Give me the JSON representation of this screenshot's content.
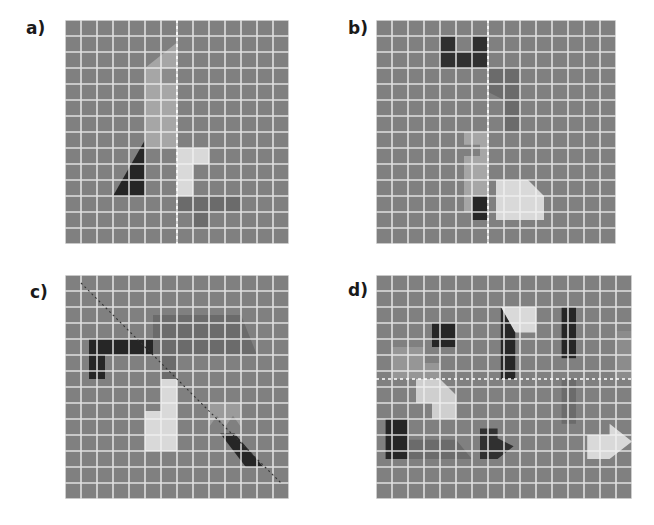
{
  "figure": {
    "width": 654,
    "height": 525,
    "background": "#ffffff"
  },
  "palette": {
    "grid_fill": "#808080",
    "grid_line": "#f2f2f2",
    "axis_dash": "#ffffff",
    "axis_dash_dark": "#333333",
    "label_color": "#1a1a1a",
    "shape_black": "#262626",
    "shape_darkgray": "#404040",
    "shape_midgray": "#595959",
    "shape_gray": "#737373",
    "shape_lightgray": "#a6a6a6",
    "shape_lighter": "#bfbfbf",
    "shape_verylight": "#d9d9d9",
    "shape_white": "#e6e6e6"
  },
  "panels": [
    {
      "id": "a",
      "label": "a)",
      "label_x": 26,
      "label_y": 20,
      "origin_x": 65,
      "origin_y": 20,
      "cols": 14,
      "rows": 14,
      "cell": 16,
      "grid_fill": "#808080",
      "grid_line": "#f2f2f2",
      "symmetry": {
        "type": "vertical",
        "position_cells": 7.0,
        "color": "#ffffff",
        "dash": "3,3"
      },
      "shapes": [
        {
          "name": "gray-pennant",
          "fill": "#a6a6a6",
          "points_cells": "5.0,8.0 5.0,3.0 7.0,1.4 7.0,8.0"
        },
        {
          "name": "gray-pennant-notch",
          "fill": "#8c8c8c",
          "points_cells": "6.0,3.0 7.0,3.0 7.0,4.0 6.0,4.0"
        },
        {
          "name": "black-triangle",
          "fill": "#262626",
          "points_cells": "3.0,11.0 5.0,7.5 5.0,11.0"
        },
        {
          "name": "light-hook",
          "fill": "#d9d9d9",
          "points_cells": "7.0,8.0 9.0,8.0 9.0,9.0 8.0,9.0 8.0,11.0 7.0,11.0"
        },
        {
          "name": "mid-tblock",
          "fill": "#6b6b6b",
          "points_cells": "7.0,11.0 11.0,11.0 11.0,12.0 9.0,12.0 9.0,13.0 8.0,13.0 8.0,12.0 7.0,12.0"
        }
      ]
    },
    {
      "id": "b",
      "label": "b)",
      "label_x": 348,
      "label_y": 20,
      "origin_x": 376,
      "origin_y": 20,
      "cols": 15,
      "rows": 14,
      "cell": 16,
      "grid_fill": "#808080",
      "grid_line": "#f2f2f2",
      "symmetry": {
        "type": "vertical",
        "position_cells": 7.0,
        "color": "#ffffff",
        "dash": "3,3"
      },
      "shapes": [
        {
          "name": "dark-ushape",
          "fill": "#303030",
          "points_cells": "4.0,1.0 5.0,1.0 5.0,2.0 6.0,2.0 6.0,1.0 7.0,1.0 7.0,3.0 4.0,3.0"
        },
        {
          "name": "gray-chevron",
          "fill": "#6b6b6b",
          "points_cells": "7.0,3.0 9.0,3.0 9.0,7.0 8.0,7.0 8.0,5.0 7.0,4.5"
        },
        {
          "name": "light-lshape",
          "fill": "#a6a6a6",
          "points_cells": "5.5,7.0 7.0,7.0 7.0,12.0 5.5,12.0 5.5,8.5 6.5,8.5 6.5,7.8 5.5,7.8"
        },
        {
          "name": "black-square",
          "fill": "#262626",
          "points_cells": "6.0,11.0 7.0,11.0 7.0,12.5 6.0,12.5"
        },
        {
          "name": "pale-pentagon",
          "fill": "#d9d9d9",
          "points_cells": "7.5,10.0 9.5,10.0 10.5,11.0 10.5,12.5 7.5,12.5"
        }
      ]
    },
    {
      "id": "c",
      "label": "c)",
      "label_x": 30,
      "label_y": 284,
      "origin_x": 65,
      "origin_y": 275,
      "cols": 14,
      "rows": 14,
      "cell": 16,
      "grid_fill": "#808080",
      "grid_line": "#f2f2f2",
      "symmetry": {
        "type": "diagonal",
        "from_cells": "1.0,0.5",
        "to_cells": "13.5,13.0",
        "color": "#333333",
        "dash": "2,3"
      },
      "shapes": [
        {
          "name": "black-hook",
          "fill": "#262626",
          "points_cells": "1.5,4.0 6.5,4.0 7.5,5.0 2.5,5.0 2.5,6.5 1.5,6.5"
        },
        {
          "name": "gray-parallelogram",
          "fill": "#6b6b6b",
          "points_cells": "5.5,2.5 11.0,2.5 12.0,5.0 7.0,5.0 7.0,6.5 6.0,6.5 6.0,5.0 5.5,5.0"
        },
        {
          "name": "pale-block",
          "fill": "#d9d9d9",
          "points_cells": "6.0,6.5 7.0,6.5 7.0,11.0 5.0,11.0 5.0,8.5 6.0,8.5"
        },
        {
          "name": "light-zigzag",
          "fill": "#9b9b9b",
          "points_cells": "9.0,8.0 11.0,8.0 11.0,9.5 10.5,8.8 10.0,9.5 9.5,8.8 9.0,9.5"
        },
        {
          "name": "black-blade",
          "fill": "#262626",
          "points_cells": "9.7,9.9 10.6,9.9 12.4,12.0 11.3,12.0"
        }
      ]
    },
    {
      "id": "d",
      "label": "d)",
      "label_x": 348,
      "label_y": 282,
      "origin_x": 376,
      "origin_y": 275,
      "cols": 16,
      "rows": 14,
      "cell": 16,
      "grid_fill": "#808080",
      "grid_line": "#f2f2f2",
      "symmetry": {
        "type": "horizontal",
        "position_cells": 6.5,
        "color": "#ffffff",
        "dash": "3,3"
      },
      "shapes": [
        {
          "name": "black-square-small",
          "fill": "#262626",
          "points_cells": "3.5,3.0 5.0,3.0 5.0,4.5 3.5,4.5"
        },
        {
          "name": "gray-step-upper",
          "fill": "#969696",
          "points_cells": "1.0,4.5 3.0,4.5 3.0,5.5 4.0,5.5 4.0,6.5 1.0,6.5"
        },
        {
          "name": "pale-step-lower",
          "fill": "#cfcfcf",
          "points_cells": "2.5,6.5 4.0,6.5 5.0,7.5 5.0,9.0 3.5,9.0 3.5,8.0 2.5,8.0"
        },
        {
          "name": "black-rect-left",
          "fill": "#262626",
          "points_cells": "0.6,9.0 2.0,9.0 2.0,11.5 0.6,11.5"
        },
        {
          "name": "gray-bar-bottom",
          "fill": "#6b6b6b",
          "points_cells": "2.0,10.3 5.0,10.3 6.0,11.5 2.0,11.5"
        },
        {
          "name": "pale-wedge-top",
          "fill": "#d9d9d9",
          "points_cells": "7.8,2.0 10.0,2.0 10.0,3.6 8.7,3.6"
        },
        {
          "name": "black-parallelogram-mid",
          "fill": "#262626",
          "points_cells": "7.8,2.0 8.7,3.6 8.7,6.5 7.8,6.5"
        },
        {
          "name": "black-parallelogram-right",
          "fill": "#262626",
          "points_cells": "11.6,2.0 12.5,2.0 12.5,5.2 11.6,5.2"
        },
        {
          "name": "gray-parallelogram-rightmid",
          "fill": "#6b6b6b",
          "points_cells": "11.6,6.5 12.5,6.5 12.5,9.3 11.6,9.3"
        },
        {
          "name": "gray-sliver-far-right",
          "fill": "#8c8c8c",
          "points_cells": "15.0,3.5 16.0,3.5 16.0,6.5 15.0,6.5"
        },
        {
          "name": "dark-arrow",
          "fill": "#303030",
          "points_cells": "6.5,9.6 7.6,9.6 7.6,10.2 8.6,10.7 7.6,11.5 6.5,11.5"
        },
        {
          "name": "pale-arrow-right",
          "fill": "#d9d9d9",
          "points_cells": "13.2,10.0 14.6,10.0 14.6,9.3 16.0,10.4 14.6,11.5 13.2,11.5"
        }
      ]
    }
  ]
}
